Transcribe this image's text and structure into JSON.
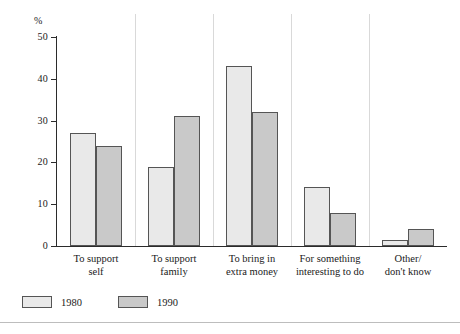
{
  "chart_data": {
    "type": "bar",
    "title": "",
    "xlabel": "",
    "ylabel": "%",
    "ylim": [
      0,
      50
    ],
    "yticks": [
      0,
      10,
      20,
      30,
      40,
      50
    ],
    "ytick_labels": [
      "0",
      "10",
      "20",
      "30",
      "40",
      "50"
    ],
    "grid": false,
    "legend_position": "bottom-left",
    "categories": [
      "To support self",
      "To support family",
      "To bring in extra money",
      "For something interesting to do",
      "Other/ don't know"
    ],
    "category_lines": [
      [
        "To support",
        "self"
      ],
      [
        "To support",
        "family"
      ],
      [
        "To bring in",
        "extra money"
      ],
      [
        "For something",
        "interesting to do"
      ],
      [
        "Other/",
        "don't know"
      ]
    ],
    "series": [
      {
        "name": "1980",
        "color": "#e9e9e9",
        "values": [
          27,
          19,
          43,
          14,
          1.5
        ]
      },
      {
        "name": "1990",
        "color": "#c9c9c9",
        "values": [
          24,
          31,
          32,
          8,
          4
        ]
      }
    ]
  },
  "legend": {
    "items": [
      {
        "label": "1980",
        "swatch": "light-gray-swatch"
      },
      {
        "label": "1990",
        "swatch": "medium-gray-swatch"
      }
    ]
  },
  "axis": {
    "unit_symbol": "%"
  }
}
